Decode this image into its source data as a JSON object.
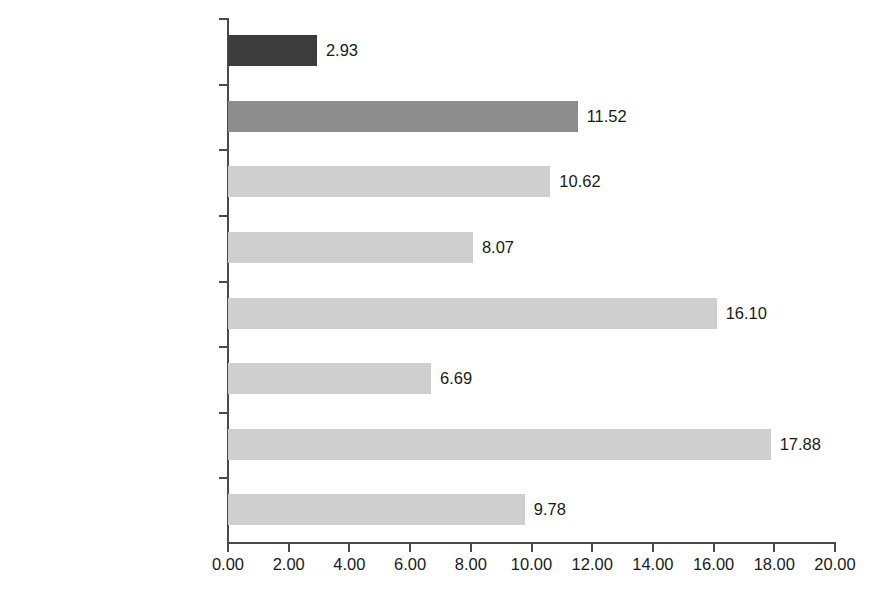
{
  "chart_data": {
    "type": "bar",
    "orientation": "horizontal",
    "title": "",
    "subtitle": "",
    "xlabel": "",
    "ylabel": "",
    "xlim": [
      0,
      20
    ],
    "xtick_step": 2,
    "grid": false,
    "legend": false,
    "value_label_format": "0.00",
    "categories": [
      "World",
      "GCC",
      "United Arab Emirates",
      "Saudi Arabia",
      "Qatar",
      "Oman",
      "Kuwait",
      "Bahrain"
    ],
    "values": [
      2.93,
      11.52,
      10.62,
      8.07,
      16.1,
      6.69,
      17.88,
      9.78
    ],
    "value_labels": [
      "2.93",
      "11.52",
      "10.62",
      "8.07",
      "16.10",
      "6.69",
      "17.88",
      "9.78"
    ],
    "bar_colors": [
      "#3c3c3c",
      "#8d8d8d",
      "#cfcfcf",
      "#cfcfcf",
      "#cfcfcf",
      "#cfcfcf",
      "#cfcfcf",
      "#cfcfcf"
    ],
    "xticks": [
      0,
      2,
      4,
      6,
      8,
      10,
      12,
      14,
      16,
      18,
      20
    ],
    "xtick_labels": [
      "0.00",
      "2.00",
      "4.00",
      "6.00",
      "8.00",
      "10.00",
      "12.00",
      "14.00",
      "16.00",
      "18.00",
      "20.00"
    ],
    "axis_color": "#4a4a4a",
    "background_color": "#ffffff",
    "text_color": "#1a1a1a"
  }
}
